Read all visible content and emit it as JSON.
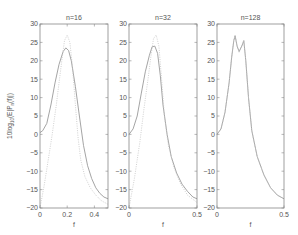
{
  "chart_data": [
    {
      "type": "line",
      "title": "n=16",
      "xlabel": "f",
      "ylabel": "10log10(E|P_n(f)|)",
      "xlim": [
        0,
        0.5
      ],
      "ylim": [
        -20,
        30
      ],
      "xticks": [
        "0",
        "0.2",
        "0.4"
      ],
      "xtick_values": [
        0,
        0.2,
        0.4
      ],
      "yticks": [
        "30",
        "25",
        "20",
        "15",
        "10",
        "5",
        "0",
        "-5",
        "-10",
        "-15",
        "-20"
      ],
      "grid": false,
      "series": [
        {
          "name": "expected (solid)",
          "style": "solid",
          "x": [
            0,
            0.02,
            0.05,
            0.08,
            0.11,
            0.14,
            0.17,
            0.19,
            0.21,
            0.23,
            0.26,
            0.29,
            0.32,
            0.35,
            0.38,
            0.41,
            0.44,
            0.47,
            0.5
          ],
          "y": [
            0.5,
            1,
            3,
            8,
            14,
            19,
            22.5,
            23.5,
            22.8,
            20,
            13,
            5,
            -3,
            -8.5,
            -12,
            -14.5,
            -16,
            -17,
            -17.5
          ]
        },
        {
          "name": "true (dotted)",
          "style": "dotted",
          "x": [
            0,
            0.03,
            0.06,
            0.09,
            0.12,
            0.14,
            0.16,
            0.18,
            0.2,
            0.22,
            0.24,
            0.26,
            0.28,
            0.3,
            0.33,
            0.37,
            0.41,
            0.45,
            0.5
          ],
          "y": [
            -20,
            -14,
            -7,
            0,
            8,
            14,
            20,
            25.5,
            27,
            25,
            18,
            8,
            -1,
            -7,
            -11.5,
            -14.5,
            -16.5,
            -18,
            -19
          ]
        }
      ]
    },
    {
      "type": "line",
      "title": "n=32",
      "xlabel": "f",
      "ylabel": "",
      "xlim": [
        0,
        0.5
      ],
      "ylim": [
        -20,
        30
      ],
      "xticks": [
        "0",
        "0.5"
      ],
      "xtick_values": [
        0,
        0.5
      ],
      "yticks": [
        "30",
        "25",
        "20",
        "15",
        "10",
        "5",
        "0",
        "-5",
        "-10",
        "-15",
        "-20"
      ],
      "grid": false,
      "series": [
        {
          "name": "expected (solid)",
          "style": "solid",
          "x": [
            0,
            0.03,
            0.06,
            0.09,
            0.12,
            0.15,
            0.17,
            0.19,
            0.21,
            0.23,
            0.25,
            0.28,
            0.31,
            0.35,
            0.39,
            0.43,
            0.47,
            0.5
          ],
          "y": [
            0,
            1.5,
            5,
            11,
            17,
            21.5,
            23.8,
            24,
            22,
            16,
            8,
            0,
            -6,
            -10.5,
            -13.5,
            -15.5,
            -17,
            -17.5
          ]
        },
        {
          "name": "true (dotted)",
          "style": "dotted",
          "x": [
            0,
            0.04,
            0.08,
            0.11,
            0.14,
            0.16,
            0.18,
            0.2,
            0.22,
            0.24,
            0.26,
            0.29,
            0.33,
            0.38,
            0.43,
            0.5
          ],
          "y": [
            -20,
            -12,
            -2,
            7,
            15,
            21,
            26,
            27,
            24,
            15,
            5,
            -3,
            -9,
            -13.5,
            -16.5,
            -18.5
          ]
        }
      ]
    },
    {
      "type": "line",
      "title": "n=128",
      "xlabel": "f",
      "ylabel": "",
      "xlim": [
        0,
        0.5
      ],
      "ylim": [
        -20,
        30
      ],
      "xticks": [
        "0",
        "0.5"
      ],
      "xtick_values": [
        0,
        0.5
      ],
      "yticks": [
        "30",
        "25",
        "20",
        "15",
        "10",
        "5",
        "0",
        "-5",
        "-10",
        "-15",
        "-20"
      ],
      "grid": false,
      "series": [
        {
          "name": "expected (solid)",
          "style": "solid",
          "x": [
            0,
            0.03,
            0.06,
            0.09,
            0.11,
            0.125,
            0.135,
            0.15,
            0.165,
            0.185,
            0.2,
            0.215,
            0.235,
            0.26,
            0.3,
            0.35,
            0.4,
            0.45,
            0.5
          ],
          "y": [
            0,
            1.5,
            6,
            14,
            21,
            25.5,
            26.8,
            24,
            22.5,
            24,
            25.5,
            20,
            10,
            1,
            -6,
            -11,
            -14.5,
            -16.5,
            -17.5
          ]
        },
        {
          "name": "true (dotted)",
          "style": "dotted",
          "x": [
            0,
            0.03,
            0.06,
            0.09,
            0.11,
            0.125,
            0.135,
            0.15,
            0.165,
            0.185,
            0.2,
            0.215,
            0.235,
            0.26,
            0.3,
            0.35,
            0.4,
            0.45,
            0.5
          ],
          "y": [
            0,
            1.5,
            6,
            14,
            21,
            25.6,
            27,
            24,
            22.3,
            24.2,
            25.6,
            20,
            10,
            1,
            -6,
            -11,
            -14.5,
            -16.5,
            -17.5
          ]
        }
      ]
    }
  ],
  "panels": [
    {
      "title": "n=16",
      "xlabel": "f"
    },
    {
      "title": "n=32",
      "xlabel": "f"
    },
    {
      "title": "n=128",
      "xlabel": "f"
    }
  ],
  "ylabel": {
    "main": "10log",
    "sub": "10",
    "rest": "(E|P",
    "sub2": "n",
    "end": "(f)|)"
  }
}
